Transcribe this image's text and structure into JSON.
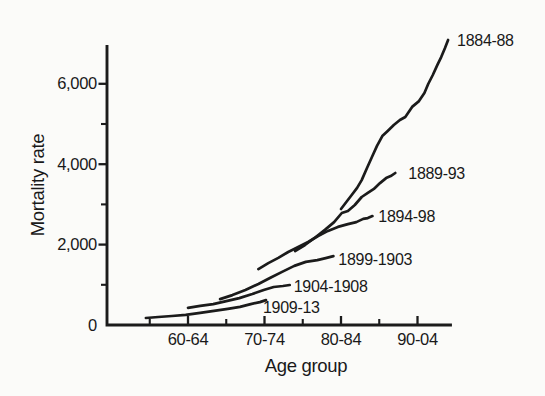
{
  "colors": {
    "ink": "#1b1b1b",
    "background": "#fbfbf9"
  },
  "chart_data": {
    "type": "line",
    "title": "",
    "xlabel": "Age group",
    "ylabel": "Mortality rate",
    "legend_position": "end-of-line-labels",
    "grid": false,
    "x_range_age": [
      51.4,
      96.5
    ],
    "y_range": [
      0,
      6965
    ],
    "x_ticks": [
      {
        "age": 62,
        "label": "60-64"
      },
      {
        "age": 72,
        "label": "70-74"
      },
      {
        "age": 82,
        "label": "80-84"
      },
      {
        "age": 92,
        "label": "90-04"
      }
    ],
    "x_minor_tick_ages": [
      57,
      67,
      77,
      87
    ],
    "y_ticks": [
      {
        "value": 0,
        "label": "0"
      },
      {
        "value": 2000,
        "label": "2,000"
      },
      {
        "value": 4000,
        "label": "4,000"
      },
      {
        "value": 6000,
        "label": "6,000"
      }
    ],
    "y_minor_tick_values": [
      1000,
      3000,
      5000
    ],
    "series": [
      {
        "name": "1884-88",
        "points": [
          [
            82.0,
            2885
          ],
          [
            82.8,
            3085
          ],
          [
            83.4,
            3235
          ],
          [
            84.1,
            3410
          ],
          [
            84.7,
            3605
          ],
          [
            85.4,
            3905
          ],
          [
            86.1,
            4205
          ],
          [
            86.7,
            4455
          ],
          [
            87.4,
            4700
          ],
          [
            88.1,
            4825
          ],
          [
            88.9,
            4975
          ],
          [
            89.7,
            5100
          ],
          [
            90.4,
            5175
          ],
          [
            91.3,
            5425
          ],
          [
            92.2,
            5570
          ],
          [
            92.9,
            5770
          ],
          [
            93.4,
            5995
          ],
          [
            94.0,
            6220
          ],
          [
            94.6,
            6470
          ],
          [
            95.1,
            6665
          ],
          [
            95.6,
            6890
          ],
          [
            96.0,
            7090
          ]
        ]
      },
      {
        "name": "1889-93",
        "points": [
          [
            76.0,
            1840
          ],
          [
            77.3,
            1990
          ],
          [
            78.7,
            2190
          ],
          [
            79.9,
            2365
          ],
          [
            81.1,
            2560
          ],
          [
            82.1,
            2785
          ],
          [
            82.9,
            2835
          ],
          [
            83.8,
            2985
          ],
          [
            84.7,
            3185
          ],
          [
            85.5,
            3285
          ],
          [
            86.3,
            3385
          ],
          [
            87.1,
            3530
          ],
          [
            87.9,
            3655
          ],
          [
            88.5,
            3705
          ],
          [
            89.1,
            3780
          ]
        ]
      },
      {
        "name": "1894-98",
        "points": [
          [
            71.2,
            1390
          ],
          [
            72.5,
            1540
          ],
          [
            73.8,
            1670
          ],
          [
            75.1,
            1815
          ],
          [
            76.4,
            1940
          ],
          [
            77.7,
            2065
          ],
          [
            79.0,
            2215
          ],
          [
            80.3,
            2340
          ],
          [
            81.6,
            2440
          ],
          [
            82.9,
            2510
          ],
          [
            84.0,
            2560
          ],
          [
            84.9,
            2640
          ],
          [
            85.5,
            2660
          ],
          [
            86.1,
            2710
          ]
        ]
      },
      {
        "name": "1899-1903",
        "points": [
          [
            66.2,
            645
          ],
          [
            67.8,
            745
          ],
          [
            69.5,
            870
          ],
          [
            71.2,
            1020
          ],
          [
            72.7,
            1170
          ],
          [
            74.3,
            1320
          ],
          [
            75.9,
            1470
          ],
          [
            77.4,
            1570
          ],
          [
            78.9,
            1615
          ],
          [
            80.0,
            1665
          ],
          [
            81.0,
            1715
          ]
        ]
      },
      {
        "name": "1904-1908",
        "points": [
          [
            62.0,
            425
          ],
          [
            63.6,
            475
          ],
          [
            65.3,
            520
          ],
          [
            67.0,
            595
          ],
          [
            68.7,
            670
          ],
          [
            70.4,
            770
          ],
          [
            71.9,
            870
          ],
          [
            73.2,
            945
          ],
          [
            74.4,
            970
          ],
          [
            75.3,
            995
          ]
        ]
      },
      {
        "name": "1909-13",
        "points": [
          [
            56.5,
            175
          ],
          [
            58.1,
            200
          ],
          [
            59.9,
            225
          ],
          [
            61.7,
            250
          ],
          [
            63.6,
            300
          ],
          [
            65.4,
            350
          ],
          [
            67.2,
            400
          ],
          [
            68.8,
            450
          ],
          [
            70.2,
            520
          ],
          [
            71.4,
            570
          ],
          [
            72.2,
            620
          ]
        ]
      }
    ]
  }
}
